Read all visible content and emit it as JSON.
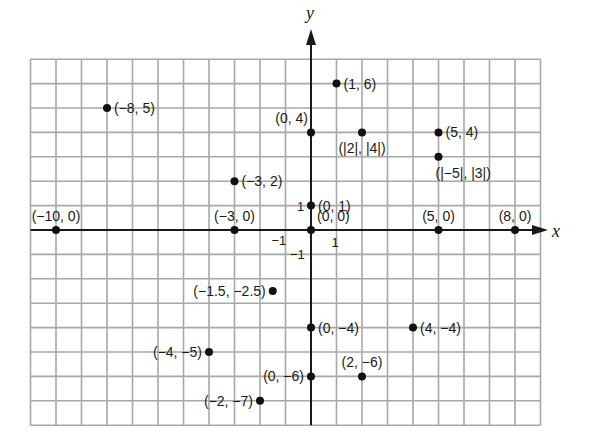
{
  "chart_data": {
    "type": "scatter",
    "title": "",
    "xlabel": "x",
    "ylabel": "y",
    "xlim": [
      -11,
      9
    ],
    "ylim": [
      -8,
      7
    ],
    "grid": true,
    "legend": null,
    "tick_labels": {
      "x_positive": "1",
      "x_negative": "-1",
      "y_positive": "1",
      "y_negative": "-1"
    },
    "points": [
      {
        "x": -8,
        "y": 5,
        "label": "(−8, 5)",
        "anchor": "right"
      },
      {
        "x": 1,
        "y": 6,
        "label": "(1, 6)",
        "anchor": "right"
      },
      {
        "x": 0,
        "y": 4,
        "label": "(0, 4)",
        "anchor": "above-left"
      },
      {
        "x": 2,
        "y": 4,
        "label": "(|2|, |4|)",
        "anchor": "below"
      },
      {
        "x": 5,
        "y": 4,
        "label": "(5, 4)",
        "anchor": "right"
      },
      {
        "x": 5,
        "y": 3,
        "label": "(|−5|, |3|)",
        "anchor": "below-right"
      },
      {
        "x": -3,
        "y": 2,
        "label": "(−3, 2)",
        "anchor": "right"
      },
      {
        "x": 0,
        "y": 1,
        "label": "(0, 1)",
        "anchor": "right"
      },
      {
        "x": 0,
        "y": 0,
        "label": "(0, 0)",
        "anchor": "above-right"
      },
      {
        "x": -10,
        "y": 0,
        "label": "(−10, 0)",
        "anchor": "above"
      },
      {
        "x": -3,
        "y": 0,
        "label": "(−3, 0)",
        "anchor": "above"
      },
      {
        "x": 5,
        "y": 0,
        "label": "(5, 0)",
        "anchor": "above"
      },
      {
        "x": 8,
        "y": 0,
        "label": "(8, 0)",
        "anchor": "above"
      },
      {
        "x": -1.5,
        "y": -2.5,
        "label": "(−1.5, −2.5)",
        "anchor": "left"
      },
      {
        "x": 0,
        "y": -4,
        "label": "(0, −4)",
        "anchor": "right"
      },
      {
        "x": 4,
        "y": -4,
        "label": "(4, −4)",
        "anchor": "right"
      },
      {
        "x": -4,
        "y": -5,
        "label": "(−4, −5)",
        "anchor": "left"
      },
      {
        "x": 0,
        "y": -6,
        "label": "(0, −6)",
        "anchor": "left"
      },
      {
        "x": 2,
        "y": -6,
        "label": "(2, −6)",
        "anchor": "above"
      },
      {
        "x": -2,
        "y": -7,
        "label": "(−2, −7)",
        "anchor": "left"
      }
    ]
  },
  "style": {
    "grid_color": "#a8a8a8",
    "axis_color": "#1a1a1a",
    "point_color": "#111111",
    "background": "#ffffff"
  }
}
